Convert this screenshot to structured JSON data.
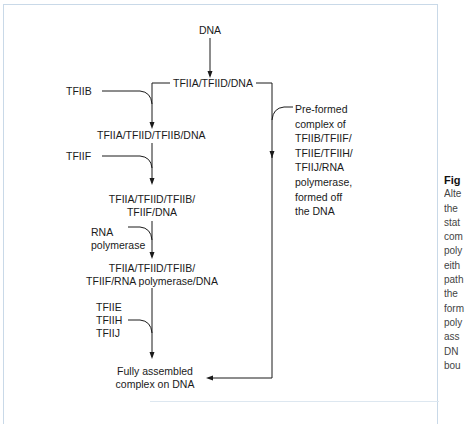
{
  "diagram": {
    "type": "flowchart",
    "nodes": {
      "dna": "DNA",
      "tfiia_tfiid_dna": "TFIIA/TFIID/DNA",
      "tfiib_input": "TFIIB",
      "tfiia_tfiid_tfiib_dna": "TFIIA/TFIID/TFIIB/DNA",
      "tfiif_input": "TFIIF",
      "tfiif_complex_line1": "TFIIA/TFIID/TFIIB/",
      "tfiif_complex_line2": "TFIIF/DNA",
      "rnap_input_line1": "RNA",
      "rnap_input_line2": "polymerase",
      "rnap_complex_line1": "TFIIA/TFIID/TFIIB/",
      "rnap_complex_line2": "TFIIF/RNA polymerase/DNA",
      "late_inputs": [
        "TFIIE",
        "TFIIH",
        "TFIIJ"
      ],
      "final_line1": "Fully assembled",
      "final_line2": "complex on DNA",
      "preformed": [
        "Pre-formed",
        "complex of",
        "TFIIB/TFIIF/",
        "TFIIE/TFIIH/",
        "TFIIJ/RNA",
        "polymerase,",
        "formed off",
        "the DNA"
      ]
    },
    "edges": [
      {
        "from": "DNA",
        "to": "TFIIA/TFIID/DNA"
      },
      {
        "from": "TFIIA/TFIID/DNA",
        "to": "TFIIA/TFIID/TFIIB/DNA",
        "joined_by": "TFIIB"
      },
      {
        "from": "TFIIA/TFIID/TFIIB/DNA",
        "to": "TFIIA/TFIID/TFIIB/TFIIF/DNA",
        "joined_by": "TFIIF"
      },
      {
        "from": "TFIIA/TFIID/TFIIB/TFIIF/DNA",
        "to": "TFIIA/TFIID/TFIIB/TFIIF/RNA polymerase/DNA",
        "joined_by": "RNA polymerase"
      },
      {
        "from": "TFIIA/TFIID/TFIIB/TFIIF/RNA polymerase/DNA",
        "to": "Fully assembled complex on DNA",
        "joined_by": "TFIIE TFIIH TFIIJ"
      },
      {
        "from": "TFIIA/TFIID/DNA",
        "to": "Fully assembled complex on DNA",
        "joined_by": "Pre-formed complex of TFIIB/TFIIF/TFIIE/TFIIH/TFIIJ/RNA polymerase, formed off the DNA"
      }
    ]
  },
  "caption": {
    "title": "Fig",
    "lines": [
      "Alte",
      "the",
      "stat",
      "com",
      "poly",
      "eith",
      "path",
      "the",
      "form",
      "poly",
      "ass",
      "DN",
      "bou"
    ]
  },
  "colors": {
    "frame": "#c9d9e8",
    "line": "#1a1a1a",
    "text": "#1a1a1a"
  }
}
